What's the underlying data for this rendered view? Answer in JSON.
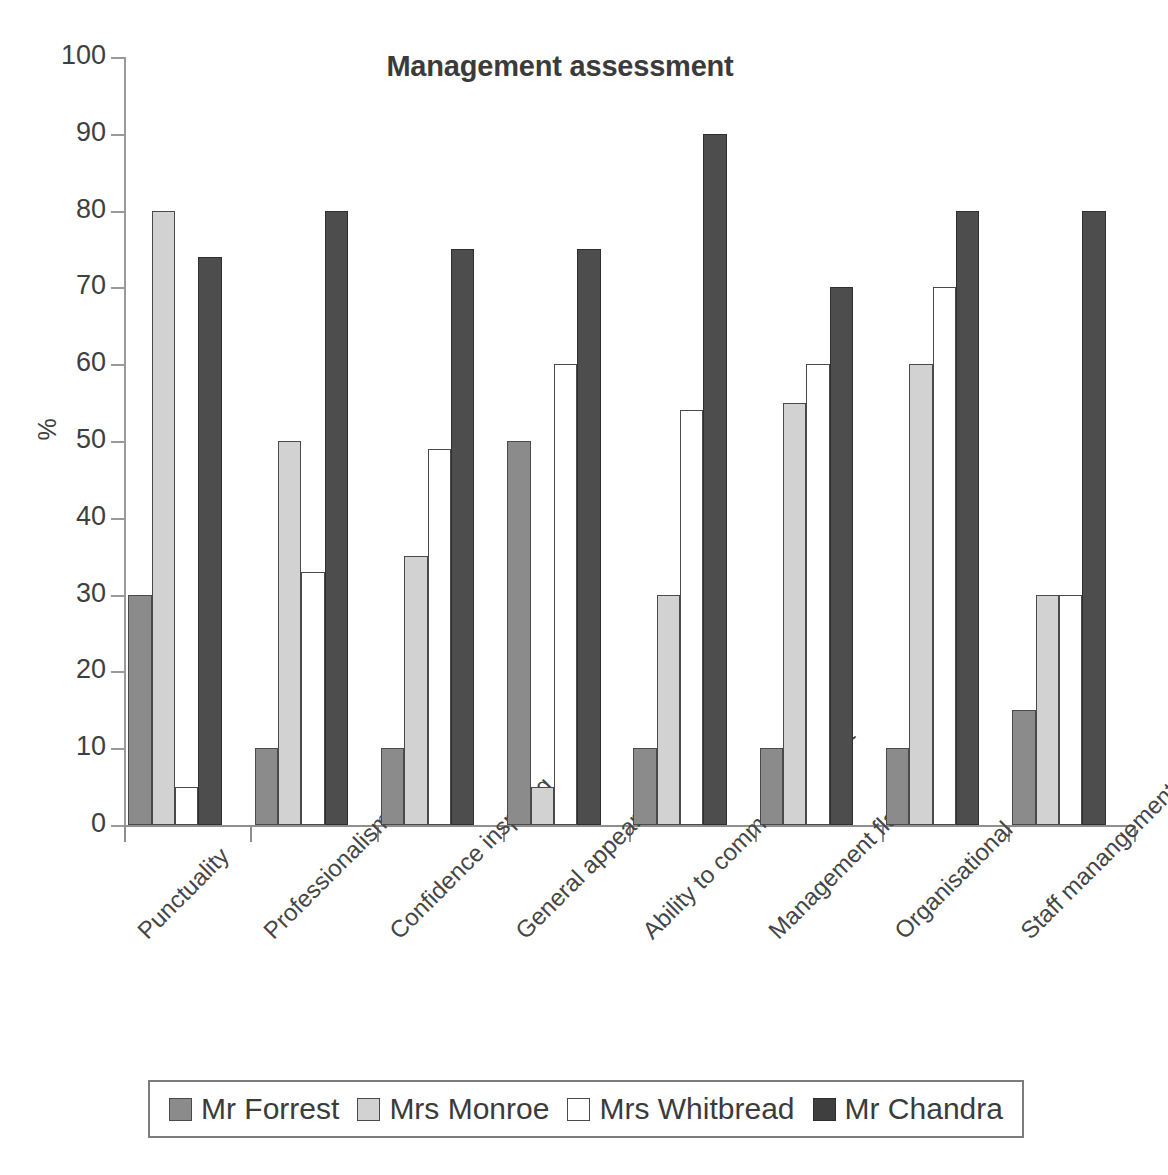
{
  "chart_data": {
    "type": "bar",
    "title": "Management assessment",
    "xlabel": "",
    "ylabel": "%",
    "ylim": [
      0,
      100
    ],
    "yticks": [
      0,
      10,
      20,
      30,
      40,
      50,
      60,
      70,
      80,
      90,
      100
    ],
    "ytick_labels": [
      "0",
      "10",
      "20",
      "30",
      "40",
      "50",
      "60",
      "70",
      "80",
      "90",
      "100"
    ],
    "grid": false,
    "legend_position": "bottom",
    "categories": [
      "Punctuality",
      "Professionalism",
      "Confidence inspiring",
      "General appearance",
      "Ability to command respect",
      "Management flair",
      "Organisational ability",
      "Staff manangement"
    ],
    "series": [
      {
        "name": "Mr Forrest",
        "color": "#8b8b8b",
        "values": [
          30,
          10,
          10,
          50,
          10,
          10,
          10,
          15
        ]
      },
      {
        "name": "Mrs Monroe",
        "color": "#d2d2d2",
        "values": [
          80,
          50,
          35,
          5,
          30,
          55,
          60,
          30
        ]
      },
      {
        "name": "Mrs Whitbread",
        "color": "#ffffff",
        "values": [
          5,
          33,
          49,
          60,
          54,
          60,
          70,
          30
        ]
      },
      {
        "name": "Mr Chandra",
        "color": "#4d4d4d",
        "values": [
          74,
          80,
          75,
          75,
          90,
          70,
          80,
          80
        ]
      }
    ]
  },
  "legend": {
    "items": [
      {
        "label": "Mr Forrest"
      },
      {
        "label": "Mrs Monroe"
      },
      {
        "label": "Mrs Whitbread"
      },
      {
        "label": "Mr Chandra"
      }
    ]
  }
}
